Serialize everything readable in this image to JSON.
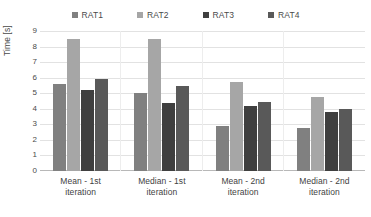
{
  "chart_data": {
    "type": "bar",
    "title": "",
    "subtitle": "",
    "xlabel": "",
    "ylabel": "Time [s]",
    "ylim": [
      0,
      9
    ],
    "yticks": [
      9,
      8,
      7,
      6,
      5,
      4,
      3,
      2,
      1,
      0
    ],
    "grid": true,
    "legend_position": "top",
    "categories": [
      "Mean - 1st iteration",
      "Median - 1st iteration",
      "Mean - 2nd iteration",
      "Median - 2nd iteration"
    ],
    "category_lines": [
      [
        "Mean - 1st",
        "iteration"
      ],
      [
        "Median - 1st",
        "iteration"
      ],
      [
        "Mean - 2nd",
        "iteration"
      ],
      [
        "Median - 2nd",
        "iteration"
      ]
    ],
    "series": [
      {
        "name": "RAT1",
        "color": "#808080",
        "values": [
          5.6,
          5.0,
          2.9,
          2.75
        ]
      },
      {
        "name": "RAT2",
        "color": "#a6a6a6",
        "values": [
          8.5,
          8.5,
          5.75,
          4.75
        ]
      },
      {
        "name": "RAT3",
        "color": "#3f3f3f",
        "values": [
          5.2,
          4.35,
          4.2,
          3.8
        ]
      },
      {
        "name": "RAT4",
        "color": "#595959",
        "values": [
          5.9,
          5.45,
          4.45,
          4.0
        ]
      }
    ]
  },
  "legend": {
    "items": [
      {
        "label": "RAT1",
        "color": "#808080"
      },
      {
        "label": "RAT2",
        "color": "#a6a6a6"
      },
      {
        "label": "RAT3",
        "color": "#3f3f3f"
      },
      {
        "label": "RAT4",
        "color": "#595959"
      }
    ]
  },
  "axes": {
    "y_title": "Time [s]"
  }
}
